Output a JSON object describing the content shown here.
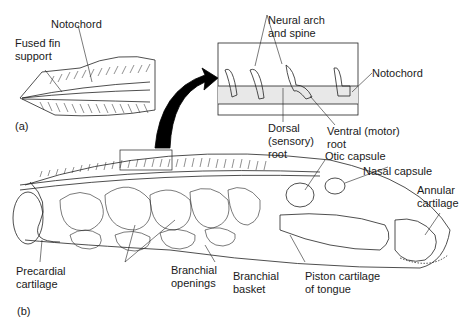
{
  "figure": {
    "panels": {
      "a": "(a)",
      "b": "(b)"
    },
    "labels_a": {
      "notochord": "Notochord",
      "fused_fin_support": "Fused fin\nsupport"
    },
    "labels_inset": {
      "neural_arch": "Neural arch\nand spine",
      "notochord": "Notochord",
      "dorsal_root": "Dorsal\n(sensory)\nroot",
      "ventral_root": "Ventral (motor)\nroot"
    },
    "labels_b": {
      "otic_capsule": "Otic capsule",
      "nasal_capsule": "Nasal capsule",
      "annular_cartilage": "Annular\ncartilage",
      "precardial_cartilage": "Precardial\ncartilage",
      "branchial_openings": "Branchial\nopenings",
      "branchial_basket": "Branchial\nbasket",
      "piston_cartilage": "Piston cartilage\nof tongue"
    }
  }
}
